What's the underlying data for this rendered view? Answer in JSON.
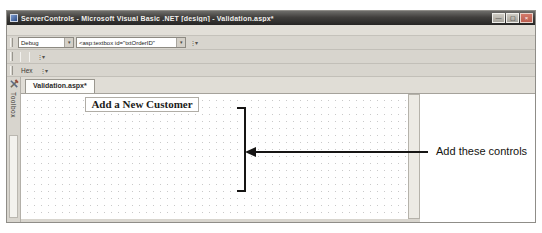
{
  "colors": {
    "chrome": "#d8d5ce",
    "titlebar": "#3e3d3b",
    "close_button": "#bb5d4f",
    "validator_text": "#a85c55",
    "grid_dot": "#c9c9c9"
  },
  "glyphs": {
    "dropdown": "▾",
    "overflow": "⋮▾",
    "superscript_mark": "*"
  },
  "window": {
    "title": "ServerControls - Microsoft Visual Basic .NET [design] - Validation.aspx*",
    "buttons": [
      {
        "name": "minimize-button",
        "glyph": "—"
      },
      {
        "name": "restore-button",
        "glyph": "▢"
      },
      {
        "name": "close-button",
        "glyph": "×"
      }
    ]
  },
  "menu_bar": {
    "items": [
      "File",
      "Edit",
      "View",
      "Project",
      "Build",
      "Debug",
      "Data",
      "Format",
      "Table",
      "Insert",
      "Frames",
      "Tools",
      "Window",
      "Help"
    ]
  },
  "toolbars": {
    "standard": {
      "icons_a": [
        {
          "name": "new-project-icon",
          "glyph": "▢",
          "caret": true
        },
        {
          "name": "add-new-item-icon",
          "glyph": "▣",
          "caret": true
        },
        {
          "name": "open-file-icon",
          "glyph": "▤"
        },
        {
          "name": "save-icon",
          "glyph": "▥"
        },
        {
          "name": "save-all-icon",
          "glyph": "▦"
        },
        {
          "sep": true
        },
        {
          "name": "cut-icon",
          "glyph": "✂"
        },
        {
          "name": "copy-icon",
          "glyph": "◫"
        },
        {
          "name": "paste-icon",
          "glyph": "▧"
        },
        {
          "sep": true
        },
        {
          "name": "undo-icon",
          "glyph": "↶",
          "caret": true
        },
        {
          "name": "redo-icon",
          "glyph": "↷",
          "caret": true
        },
        {
          "sep": true
        },
        {
          "name": "start-icon",
          "glyph": "▸",
          "accent": true
        }
      ],
      "config_combo_value": "Debug",
      "icons_b": [
        {
          "name": "find-in-files-icon",
          "glyph": "◉"
        }
      ],
      "find_combo_value": "<asp:textbox id=\"txtOrderID\"",
      "icons_c": [
        {
          "name": "solution-explorer-icon",
          "glyph": "◧"
        },
        {
          "name": "properties-window-icon",
          "glyph": "◨"
        },
        {
          "name": "toolbox-panel-icon",
          "glyph": "◩"
        }
      ]
    },
    "formatting": {
      "icons_a": [
        {
          "name": "css-style-icon",
          "glyph": "◧"
        },
        {
          "name": "outline-icon",
          "glyph": "◨",
          "caret": true
        }
      ],
      "style_combo_values": [
        "",
        "",
        ""
      ],
      "letters": [
        {
          "name": "bold-button",
          "glyph": "B",
          "cls": ""
        },
        {
          "name": "italic-button",
          "glyph": "I",
          "cls": "i"
        },
        {
          "name": "underline-button",
          "glyph": "U",
          "cls": "u"
        }
      ],
      "color_icons": [
        {
          "name": "font-color-icon",
          "glyph": "A"
        },
        {
          "name": "highlight-color-icon",
          "glyph": "A"
        }
      ],
      "align_icons": [
        {
          "name": "align-left-icon",
          "glyph": "≡"
        },
        {
          "name": "align-center-icon",
          "glyph": "≡"
        },
        {
          "name": "align-right-icon",
          "glyph": "≡"
        },
        {
          "name": "justify-icon",
          "glyph": "≡"
        }
      ],
      "list_icons": [
        {
          "name": "numbered-list-icon",
          "glyph": "≔"
        },
        {
          "name": "bulleted-list-icon",
          "glyph": "⁖"
        }
      ]
    },
    "debug": {
      "icons_a": [
        {
          "name": "continue-icon",
          "glyph": "▸",
          "accent": true
        },
        {
          "name": "break-all-icon",
          "glyph": "‖"
        },
        {
          "name": "stop-debugging-icon",
          "glyph": "■"
        },
        {
          "name": "restart-icon",
          "glyph": "↻"
        },
        {
          "sep": true
        },
        {
          "name": "show-next-statement-icon",
          "glyph": "→"
        },
        {
          "name": "step-into-icon",
          "glyph": "↓"
        },
        {
          "name": "step-over-icon",
          "glyph": "↷"
        },
        {
          "name": "step-out-icon",
          "glyph": "↑"
        },
        {
          "sep": true
        }
      ],
      "hex_label": "Hex",
      "icons_b": [
        {
          "name": "breakpoints-window-icon",
          "glyph": "▣",
          "caret": true
        }
      ]
    }
  },
  "toolbox_tab": {
    "label": "Toolbox"
  },
  "document_tab": {
    "label": "Validation.aspx*"
  },
  "tab_nav": [
    {
      "name": "tab-scroll-button",
      "glyph": "▾"
    },
    {
      "name": "close-document-button",
      "glyph": "×"
    }
  ],
  "designer": {
    "heading": "Add a New Customer",
    "validator_text": "RequiredFieldValidator",
    "rows": [
      {
        "label": "Last Name:",
        "sub": "",
        "size": "long",
        "validator": true
      },
      {
        "label": "First Name:",
        "sub": "",
        "size": "long",
        "validator": true
      },
      {
        "label": "MI:",
        "sub": "",
        "size": "short",
        "validator": false
      },
      {
        "label": "Birth Date:",
        "sub": "(mm/dd/yyyy)",
        "size": "long",
        "validator": false
      },
      {
        "label": "Age:",
        "sub": "",
        "size": "short",
        "validator": false
      },
      {
        "label": "Home Phone:",
        "sub": "(xxx-xxx-xxxx)",
        "size": "long",
        "validator": true
      },
      {
        "label": "Username:",
        "sub": "",
        "size": "long",
        "validator": false
      },
      {
        "label": "Password:",
        "sub": "",
        "size": "long",
        "validator": false
      }
    ]
  },
  "annotation": {
    "label": "Add these controls"
  }
}
